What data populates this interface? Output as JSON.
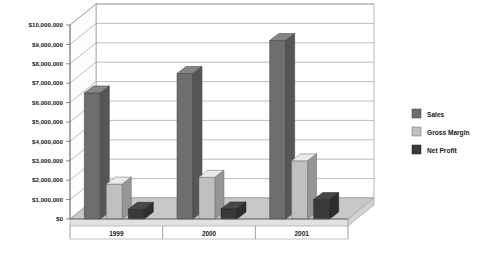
{
  "chart_data": {
    "type": "bar",
    "title": "",
    "subtitle": "",
    "xlabel": "",
    "ylabel": "",
    "categories": [
      "1999",
      "2000",
      "2001"
    ],
    "series": [
      {
        "name": "Sales",
        "values": [
          6500000,
          7500000,
          9200000
        ],
        "color": "#6e6e6e"
      },
      {
        "name": "Gross Margin",
        "values": [
          1800000,
          2150000,
          3000000
        ],
        "color": "#c0c0c0"
      },
      {
        "name": "Net Profit",
        "values": [
          500000,
          520000,
          1000000
        ],
        "color": "#3a3a3a"
      }
    ],
    "ylim": [
      0,
      10000000
    ],
    "ytick_values": [
      0,
      1000000,
      2000000,
      3000000,
      4000000,
      5000000,
      6000000,
      7000000,
      8000000,
      9000000,
      10000000
    ],
    "ytick_labels": [
      "$0",
      "$1,000,000",
      "$2,000,000",
      "$3,000,000",
      "$4,000,000",
      "$5,000,000",
      "$6,000,000",
      "$7,000,000",
      "$8,000,000",
      "$9,000,000",
      "$10,000,000"
    ],
    "grid": true,
    "grid_axis": "y",
    "legend_position": "right",
    "three_d": true,
    "background": "#ffffff",
    "plot_background": "#ffffff",
    "axis_line_color": "#808080",
    "grid_color": "#909090",
    "floor_color": "#c8c8c8",
    "wall_color": "#ffffff"
  },
  "legend": {
    "items": [
      {
        "label": "Sales",
        "color": "#6e6e6e"
      },
      {
        "label": "Gross Margin",
        "color": "#c0c0c0"
      },
      {
        "label": "Net Profit",
        "color": "#3a3a3a"
      }
    ]
  }
}
